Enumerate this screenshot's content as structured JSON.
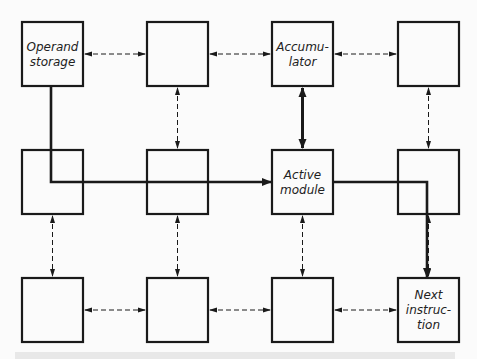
{
  "diagram": {
    "grid": {
      "rows": 3,
      "cols": 4
    },
    "modules": [
      {
        "id": "m00",
        "row": 0,
        "col": 0,
        "label": [
          "Operand",
          "storage"
        ]
      },
      {
        "id": "m01",
        "row": 0,
        "col": 1,
        "label": []
      },
      {
        "id": "m02",
        "row": 0,
        "col": 2,
        "label": [
          "Accumu-",
          "lator"
        ]
      },
      {
        "id": "m03",
        "row": 0,
        "col": 3,
        "label": []
      },
      {
        "id": "m10",
        "row": 1,
        "col": 0,
        "label": []
      },
      {
        "id": "m11",
        "row": 1,
        "col": 1,
        "label": []
      },
      {
        "id": "m12",
        "row": 1,
        "col": 2,
        "label": [
          "Active",
          "module"
        ]
      },
      {
        "id": "m13",
        "row": 1,
        "col": 3,
        "label": []
      },
      {
        "id": "m20",
        "row": 2,
        "col": 0,
        "label": []
      },
      {
        "id": "m21",
        "row": 2,
        "col": 1,
        "label": []
      },
      {
        "id": "m22",
        "row": 2,
        "col": 2,
        "label": []
      },
      {
        "id": "m23",
        "row": 2,
        "col": 3,
        "label": [
          "Next",
          "instruc-",
          "tion"
        ]
      }
    ],
    "dashed_links": [
      {
        "from": "m00",
        "to": "m01"
      },
      {
        "from": "m01",
        "to": "m02"
      },
      {
        "from": "m02",
        "to": "m03"
      },
      {
        "from": "m01",
        "to": "m11"
      },
      {
        "from": "m03",
        "to": "m13"
      },
      {
        "from": "m10",
        "to": "m20"
      },
      {
        "from": "m11",
        "to": "m21"
      },
      {
        "from": "m12",
        "to": "m22"
      },
      {
        "from": "m13",
        "to": "m23"
      },
      {
        "from": "m20",
        "to": "m21"
      },
      {
        "from": "m21",
        "to": "m22"
      },
      {
        "from": "m22",
        "to": "m23"
      }
    ],
    "bold_links": [
      {
        "from": "m02",
        "to": "m12",
        "type": "bidirectional"
      },
      {
        "from": "m00",
        "to": "m12",
        "type": "operand-path"
      },
      {
        "from": "m12",
        "to": "m23",
        "type": "next-instruction-path"
      }
    ],
    "colors": {
      "ink": "#1a1a1a",
      "background": "#fbfbfb"
    }
  }
}
